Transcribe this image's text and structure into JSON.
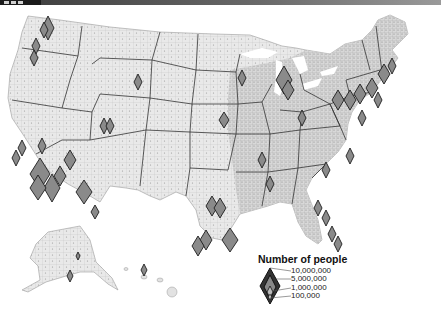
{
  "header": {
    "bar_color": "#4a4a4a",
    "tab_color": "#1a1a1a"
  },
  "map": {
    "title": "US population by county",
    "region": "United States (counties), with Alaska and Hawaii insets",
    "land_color": "#e8e8e8",
    "border_color": "#555555",
    "symbol_fill": "#8a8a8a",
    "symbol_stroke": "#222222",
    "symbol_shape": "diamond"
  },
  "legend": {
    "title": "Number of people",
    "items": [
      {
        "label": "10,000,000",
        "value": 10000000
      },
      {
        "label": "5,000,000",
        "value": 5000000
      },
      {
        "label": "1,000,000",
        "value": 1000000
      },
      {
        "label": "100,000",
        "value": 100000
      }
    ]
  }
}
